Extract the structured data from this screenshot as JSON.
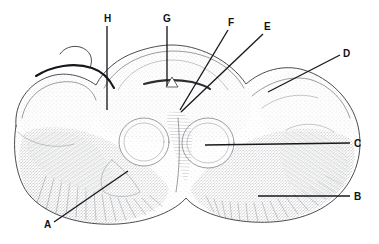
{
  "figure": {
    "medium": "stippled and hatched anatomical line drawing",
    "background_color": "#ffffff",
    "ink_color": "#16181c",
    "width": 379,
    "height": 244
  },
  "labels": [
    {
      "id": "label-h",
      "text": "H",
      "x": 104,
      "y": 22,
      "leader": {
        "x1": 107,
        "y1": 26,
        "x2": 107,
        "y2": 110
      },
      "leader_kind": "vertical"
    },
    {
      "id": "label-g",
      "text": "G",
      "x": 163,
      "y": 22,
      "leader": {
        "x1": 167,
        "y1": 26,
        "x2": 167,
        "y2": 86
      },
      "leader_kind": "vertical"
    },
    {
      "id": "label-f",
      "text": "F",
      "x": 228,
      "y": 26,
      "leader": {
        "x1": 228,
        "y1": 30,
        "x2": 180,
        "y2": 110
      },
      "leader_kind": "diagonal"
    },
    {
      "id": "label-e",
      "text": "E",
      "x": 264,
      "y": 30,
      "leader": {
        "x1": 263,
        "y1": 34,
        "x2": 181,
        "y2": 112
      },
      "leader_kind": "diagonal"
    },
    {
      "id": "label-d",
      "text": "D",
      "x": 343,
      "y": 57,
      "leader": {
        "x1": 340,
        "y1": 55,
        "x2": 268,
        "y2": 92
      },
      "leader_kind": "diagonal"
    },
    {
      "id": "label-c",
      "text": "C",
      "x": 354,
      "y": 147,
      "leader": {
        "x1": 350,
        "y1": 143,
        "x2": 205,
        "y2": 145
      },
      "leader_kind": "horizontal"
    },
    {
      "id": "label-b",
      "text": "B",
      "x": 354,
      "y": 200,
      "leader": {
        "x1": 350,
        "y1": 196,
        "x2": 258,
        "y2": 196
      },
      "leader_kind": "horizontal"
    },
    {
      "id": "label-a",
      "text": "A",
      "x": 44,
      "y": 228,
      "leader": {
        "x1": 54,
        "y1": 222,
        "x2": 128,
        "y2": 171
      },
      "leader_kind": "diagonal"
    }
  ],
  "label_letters": [
    "A",
    "B",
    "C",
    "D",
    "E",
    "F",
    "G",
    "H"
  ],
  "structures": [
    {
      "name": "central-canal",
      "shape": "small inverted tent outline",
      "x": 172,
      "y": 82
    },
    {
      "name": "olive-left",
      "shape": "oval nucleus",
      "cx": 144,
      "cy": 142,
      "rx": 25,
      "ry": 24
    },
    {
      "name": "olive-right",
      "shape": "oval nucleus",
      "cx": 208,
      "cy": 143,
      "rx": 26,
      "ry": 25
    },
    {
      "name": "dorsal-roof",
      "shape": "arched dorsal surface",
      "x": 167,
      "y": 48
    },
    {
      "name": "lateral-lobe-left",
      "shape": "rounded lateral lobe",
      "x": 55,
      "y": 95
    },
    {
      "name": "lateral-lobe-right",
      "shape": "rounded lateral lobe",
      "x": 300,
      "y": 100
    },
    {
      "name": "ventral-pyramid-left",
      "shape": "radially hatched wedge",
      "x": 95,
      "y": 195
    },
    {
      "name": "ventral-pyramid-right",
      "shape": "radially hatched wedge",
      "x": 250,
      "y": 198
    }
  ]
}
